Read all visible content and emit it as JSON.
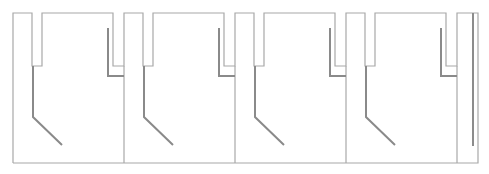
{
  "diagram": {
    "width": 489,
    "height": 174,
    "colors": {
      "background": "#ffffff",
      "outline": "#a8a8a8",
      "inner": "#8a8a8a"
    },
    "layout": {
      "top": 13,
      "bottom": 163,
      "slot_bottom": 66,
      "module_width": 111,
      "first_module_x": 13,
      "slot_offset": 19,
      "slot_width": 10,
      "inner_top": 28,
      "inner_step_y": 76,
      "inner_mid_y": 117,
      "diag_end_dx": 29,
      "diag_end_y": 145
    },
    "modules": [
      {
        "x": 13
      },
      {
        "x": 124
      },
      {
        "x": 235
      },
      {
        "x": 346
      }
    ],
    "end_cap": {
      "x": 457,
      "right": 478,
      "bar_x": 473,
      "bar_top": 13,
      "bar_bottom": 146
    }
  }
}
